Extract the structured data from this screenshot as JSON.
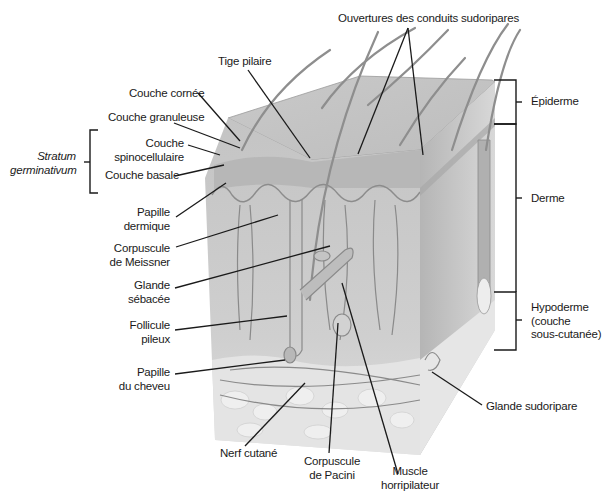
{
  "diagram": {
    "type": "anatomical-illustration",
    "labels": {
      "ouvertures": "Ouvertures des conduits sudoripares",
      "tige_pilaire": "Tige pilaire",
      "couche_cornee": "Couche cornée",
      "couche_granuleuse": "Couche granuleuse",
      "stratum_line1": "Stratum",
      "stratum_line2": "germinativum",
      "couche_spino_line1": "Couche",
      "couche_spino_line2": "spinocellulaire",
      "couche_basale": "Couche basale",
      "papille_dermique_line1": "Papille",
      "papille_dermique_line2": "dermique",
      "meissner_line1": "Corpuscule",
      "meissner_line2": "de Meissner",
      "glande_sebacee_line1": "Glande",
      "glande_sebacee_line2": "sébacée",
      "follicule_line1": "Follicule",
      "follicule_line2": "pileux",
      "papille_cheveu_line1": "Papille",
      "papille_cheveu_line2": "du cheveu",
      "nerf_cutane": "Nerf cutané",
      "pacini_line1": "Corpuscule",
      "pacini_line2": "de Pacini",
      "muscle_line1": "Muscle",
      "muscle_line2": "horripilateur",
      "glande_sudoripare": "Glande sudoripare",
      "epiderme": "Épiderme",
      "derme": "Derme",
      "hypoderme_line1": "Hypoderme",
      "hypoderme_line2": "(couche",
      "hypoderme_line3": "sous-cutanée)"
    }
  }
}
